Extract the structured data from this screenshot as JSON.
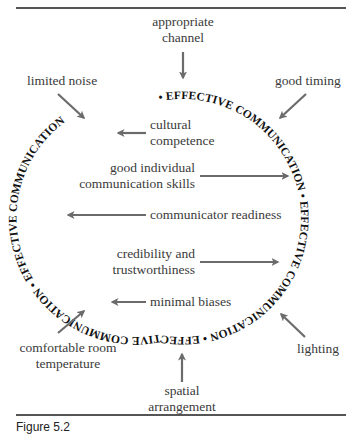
{
  "figure": {
    "ring_text": "EFFECTIVE COMMUNICATION • ",
    "ring_repeat": 4,
    "colors": {
      "arrow": "#6b6b6b",
      "ring_text": "#111111",
      "label_text": "#3a3a3a",
      "rule": "#555555"
    },
    "outside_factors": {
      "top": [
        "appropriate",
        "channel"
      ],
      "top_left": [
        "limited noise"
      ],
      "top_right": [
        "good timing"
      ],
      "bottom_left": [
        "comfortable room",
        "temperature"
      ],
      "bottom_right": [
        "lighting"
      ],
      "bottom": [
        "spatial",
        "arrangement"
      ]
    },
    "inside_factors": {
      "cultural_competence": [
        "cultural",
        "competence"
      ],
      "communication_skills": [
        "good individual",
        "communication skills"
      ],
      "communicator_readiness": [
        "communicator readiness"
      ],
      "credibility": [
        "credibility and",
        "trustworthiness"
      ],
      "minimal_biases": [
        "minimal biases"
      ]
    },
    "caption_partial": "Figure 5.2"
  }
}
